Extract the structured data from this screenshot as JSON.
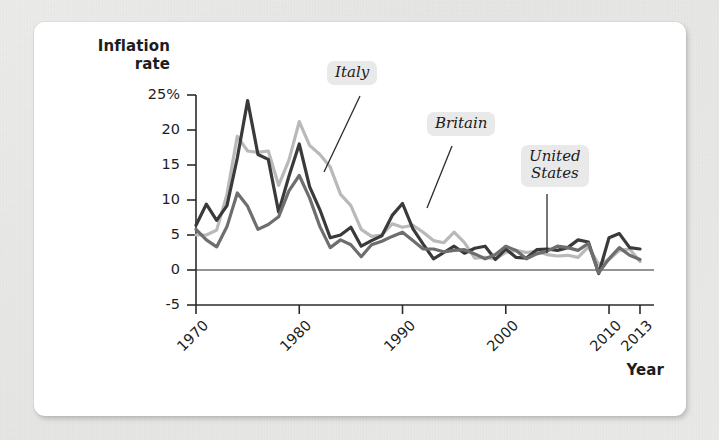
{
  "figure": {
    "y_axis_title": "Inflation\nrate",
    "x_axis_title": "Year"
  },
  "colors": {
    "italy": "#b9b9b9",
    "britain": "#3a3a3a",
    "united_states": "#6e6e6e",
    "axis": "#2b2b2b",
    "card": "#ffffff",
    "page": "#e9e9e7",
    "label_chip": "#e9e9e9"
  },
  "labels": {
    "italy": "Italy",
    "britain": "Britain",
    "united_states": "United\nStates"
  },
  "chart_data": {
    "type": "line",
    "title": "",
    "xlabel": "Year",
    "ylabel": "Inflation rate",
    "xlim": [
      1970,
      2013
    ],
    "ylim": [
      -5,
      25
    ],
    "yticks": [
      -5,
      0,
      5,
      10,
      15,
      20,
      25
    ],
    "ytick_labels": [
      "-5",
      "0",
      "5",
      "10",
      "15",
      "20",
      "25%"
    ],
    "xticks": [
      1970,
      1980,
      1990,
      2000,
      2010,
      2013
    ],
    "xtick_labels": [
      "1970",
      "1980",
      "1990",
      "2000",
      "2010",
      "2013"
    ],
    "grid": false,
    "legend": "callout-labels",
    "x": [
      1970,
      1971,
      1972,
      1973,
      1974,
      1975,
      1976,
      1977,
      1978,
      1979,
      1980,
      1981,
      1982,
      1983,
      1984,
      1985,
      1986,
      1987,
      1988,
      1989,
      1990,
      1991,
      1992,
      1993,
      1994,
      1995,
      1996,
      1997,
      1998,
      1999,
      2000,
      2001,
      2002,
      2003,
      2004,
      2005,
      2006,
      2007,
      2008,
      2009,
      2010,
      2011,
      2012,
      2013
    ],
    "series": [
      {
        "name": "Italy",
        "color": "#b9b9b9",
        "values": [
          5.0,
          5.0,
          5.7,
          10.8,
          19.1,
          17.0,
          16.8,
          17.0,
          12.1,
          15.7,
          21.2,
          17.8,
          16.5,
          14.7,
          10.8,
          9.2,
          5.8,
          4.8,
          5.0,
          6.6,
          6.1,
          6.4,
          5.4,
          4.2,
          3.9,
          5.4,
          3.9,
          1.7,
          1.8,
          1.6,
          2.5,
          2.8,
          2.5,
          2.7,
          2.2,
          2.0,
          2.1,
          1.8,
          3.3,
          0.8,
          1.5,
          2.8,
          3.0,
          1.2
        ]
      },
      {
        "name": "Britain",
        "color": "#3a3a3a",
        "values": [
          6.4,
          9.4,
          7.1,
          9.2,
          16.0,
          24.2,
          16.5,
          15.8,
          8.3,
          13.4,
          18.0,
          11.9,
          8.6,
          4.6,
          5.0,
          6.1,
          3.4,
          4.2,
          4.9,
          7.8,
          9.5,
          5.9,
          3.7,
          1.6,
          2.5,
          3.4,
          2.4,
          3.1,
          3.4,
          1.5,
          3.0,
          1.8,
          1.7,
          2.9,
          3.0,
          2.8,
          3.2,
          4.3,
          4.0,
          -0.5,
          4.6,
          5.2,
          3.2,
          3.0
        ]
      },
      {
        "name": "United States",
        "color": "#6e6e6e",
        "values": [
          5.8,
          4.3,
          3.3,
          6.2,
          11.0,
          9.1,
          5.8,
          6.5,
          7.6,
          11.3,
          13.5,
          10.3,
          6.2,
          3.2,
          4.3,
          3.6,
          1.9,
          3.6,
          4.1,
          4.8,
          5.4,
          4.2,
          3.0,
          3.0,
          2.6,
          2.8,
          2.9,
          2.3,
          1.6,
          2.2,
          3.4,
          2.8,
          1.6,
          2.3,
          2.7,
          3.4,
          3.2,
          2.8,
          3.8,
          -0.4,
          1.6,
          3.2,
          2.1,
          1.5
        ]
      }
    ],
    "annotations": [
      {
        "text": "Italy",
        "points_to_year": 1983,
        "points_to_value": 14.2
      },
      {
        "text": "Britain",
        "points_to_year": 1990,
        "points_to_value": 9.5
      },
      {
        "text": "United States",
        "points_to_year": 2005,
        "points_to_value": 3.4
      }
    ]
  }
}
